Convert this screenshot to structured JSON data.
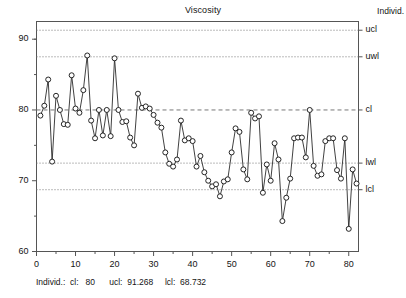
{
  "chart_data": {
    "type": "line",
    "title": "Viscosity",
    "xlabel": "",
    "ylabel": "",
    "series_name": "Individ.",
    "xlim": [
      0,
      82.5
    ],
    "ylim": [
      60,
      92.5
    ],
    "grid": true,
    "marker": "open-circle",
    "legend_position": "right-axis",
    "x": [
      1,
      2,
      3,
      4,
      5,
      6,
      7,
      8,
      9,
      10,
      11,
      12,
      13,
      14,
      15,
      16,
      17,
      18,
      19,
      20,
      21,
      22,
      23,
      24,
      25,
      26,
      27,
      28,
      29,
      30,
      31,
      32,
      33,
      34,
      35,
      36,
      37,
      38,
      39,
      40,
      41,
      42,
      43,
      44,
      45,
      46,
      47,
      48,
      49,
      50,
      51,
      52,
      53,
      54,
      55,
      56,
      57,
      58,
      59,
      60,
      61,
      62,
      63,
      64,
      65,
      66,
      67,
      68,
      69,
      70,
      71,
      72,
      73,
      74,
      75,
      76,
      77,
      78,
      79,
      80,
      81,
      82
    ],
    "values": [
      79.2,
      80.6,
      84.3,
      72.7,
      82.0,
      80.0,
      78.0,
      77.9,
      84.9,
      80.2,
      79.6,
      82.8,
      87.7,
      78.5,
      76.0,
      80.0,
      76.4,
      80.0,
      76.3,
      87.3,
      80.0,
      78.3,
      78.4,
      76.1,
      75.0,
      82.3,
      80.3,
      80.5,
      80.2,
      79.3,
      78.2,
      77.5,
      74.0,
      72.4,
      72.0,
      73.0,
      78.5,
      75.7,
      76.0,
      75.6,
      72.0,
      73.5,
      71.2,
      70.0,
      69.2,
      69.5,
      67.8,
      69.9,
      70.2,
      74.0,
      77.4,
      76.9,
      71.6,
      70.2,
      79.6,
      78.8,
      79.1,
      68.3,
      72.3,
      70.0,
      75.3,
      73.0,
      64.3,
      67.6,
      70.3,
      76.0,
      76.1,
      76.1,
      73.3,
      80.0,
      72.1,
      70.7,
      70.9,
      75.6,
      76.0,
      76.0,
      71.5,
      70.3,
      76.0,
      63.2,
      71.6,
      69.6
    ],
    "control_lines": [
      {
        "id": "ucl",
        "label": "ucl",
        "value": 91.268,
        "style": "dotted"
      },
      {
        "id": "uwl",
        "label": "uwl",
        "value": 87.512,
        "style": "dotted"
      },
      {
        "id": "cl",
        "label": "cl",
        "value": 80,
        "style": "dashed"
      },
      {
        "id": "lwl",
        "label": "lwl",
        "value": 72.488,
        "style": "dotted"
      },
      {
        "id": "lcl",
        "label": "lcl",
        "value": 68.732,
        "style": "dotted"
      }
    ],
    "y_ticks": [
      60,
      70,
      80,
      90
    ],
    "y_ticklabels": [
      "60",
      "70",
      "80",
      "90"
    ],
    "y_minor_ticks": [
      65,
      75,
      85,
      90
    ],
    "x_ticks": [
      0,
      10,
      20,
      30,
      40,
      50,
      60,
      70,
      80
    ],
    "x_ticklabels": [
      "0",
      "10",
      "20",
      "30",
      "40",
      "50",
      "60",
      "70",
      "80"
    ],
    "x_minor_ticks": [
      5,
      15,
      25,
      35,
      45,
      55,
      65,
      75
    ],
    "colors": {
      "line": "#2b2b2b",
      "marker_edge": "#1a1a1a",
      "marker_face": "#ffffff",
      "grid": "#777777",
      "frame": "#555555",
      "text": "#141414"
    }
  },
  "header": {
    "right_label": "Individ."
  },
  "caption": {
    "text": "Individ.:  cl:   80      ucl:  91.268     lcl:  68.732"
  }
}
